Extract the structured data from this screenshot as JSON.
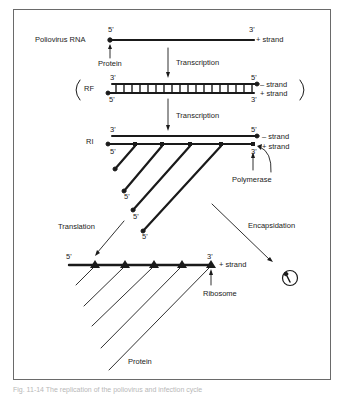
{
  "diagram": {
    "title_row": {
      "label": "Poliovirus RNA",
      "five_prime": "5'",
      "three_prime": "3'",
      "strand": "+ strand"
    },
    "protein_label": "Protein",
    "transcription_1": "Transcription",
    "rf": {
      "label": "RF",
      "top_left": "3'",
      "top_right": "5'",
      "bottom_left": "5'",
      "bottom_right": "3'",
      "minus_strand": "– strand",
      "plus_strand": "+ strand"
    },
    "transcription_2": "Transcription",
    "ri": {
      "label": "RI",
      "top_left": "3'",
      "top_right": "5'",
      "bottom_left": "5'",
      "bottom_right": "3'",
      "minus_strand": "– strand",
      "plus_strand": "+ strand",
      "branch_ends": [
        "5'",
        "5'",
        "5'"
      ]
    },
    "polymerase_label": "Polymerase",
    "translation_label": "Translation",
    "encapsidation_label": "Encapsidation",
    "polysome": {
      "five_prime": "5'",
      "three_prime": "3'",
      "strand": "+ strand",
      "ribosome_label": "Ribosome",
      "protein_label": "Protein"
    },
    "virion_icon": "virion-icon"
  },
  "caption": "Fig. 11-14  The replication of the poliovirus and infection cycle"
}
